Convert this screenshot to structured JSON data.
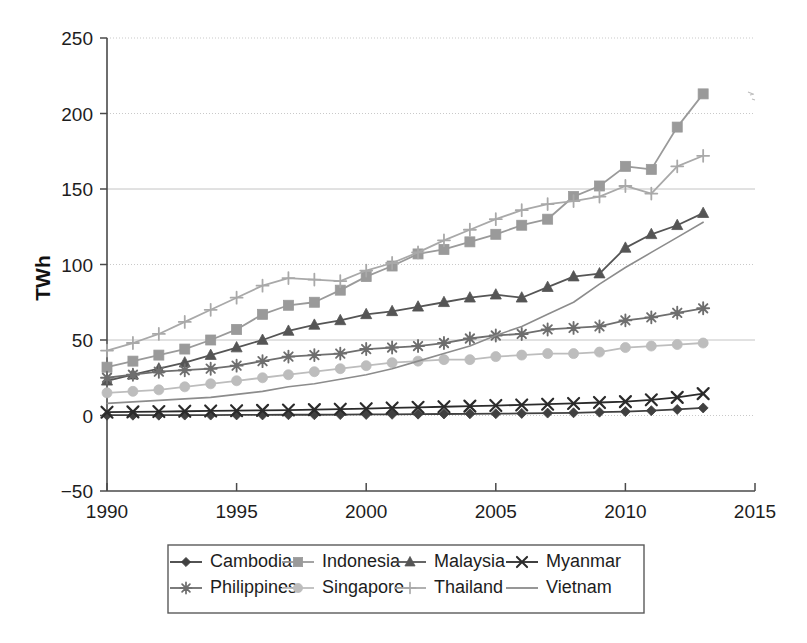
{
  "chart_data": {
    "type": "line",
    "title": "",
    "xlabel": "",
    "ylabel": "TWh",
    "xlim": [
      1990,
      2015
    ],
    "ylim": [
      -50,
      250
    ],
    "ytick_values": [
      250,
      200,
      150,
      100,
      50,
      0,
      -50
    ],
    "ytick_labels": [
      "250",
      "200",
      "150",
      "100",
      "50",
      "0",
      "−50"
    ],
    "xtick_values": [
      1990,
      1995,
      2000,
      2005,
      2010,
      2015
    ],
    "xtick_labels": [
      "1990",
      "1995",
      "2000",
      "2005",
      "2010",
      "2015"
    ],
    "grid": "horizontal",
    "legend_position": "bottom",
    "x": [
      1990,
      1991,
      1992,
      1993,
      1994,
      1995,
      1996,
      1997,
      1998,
      1999,
      2000,
      2001,
      2002,
      2003,
      2004,
      2005,
      2006,
      2007,
      2008,
      2009,
      2010,
      2011,
      2012,
      2013
    ],
    "series": [
      {
        "name": "Cambodia",
        "marker": "diamond",
        "color": "#404040",
        "values": [
          0.2,
          0.2,
          0.2,
          0.3,
          0.3,
          0.4,
          0.4,
          0.5,
          0.5,
          0.6,
          0.7,
          0.8,
          0.9,
          1.0,
          1.1,
          1.2,
          1.4,
          1.6,
          1.8,
          2.2,
          2.6,
          3.2,
          4.0,
          5.0
        ]
      },
      {
        "name": "Indonesia",
        "marker": "square",
        "color": "#9a9a9a",
        "values": [
          32,
          36,
          40,
          44,
          50,
          57,
          67,
          73,
          75,
          83,
          92,
          99,
          107,
          110,
          115,
          120,
          126,
          130,
          145,
          152,
          165,
          163,
          191,
          213
        ]
      },
      {
        "name": "Malaysia",
        "marker": "triangle",
        "color": "#555555",
        "values": [
          23,
          27,
          31,
          35,
          40,
          45,
          50,
          56,
          60,
          63,
          67,
          69,
          72,
          75,
          78,
          80,
          78,
          85,
          92,
          94,
          111,
          120,
          126,
          134
        ]
      },
      {
        "name": "Myanmar",
        "marker": "x",
        "color": "#2b2b2b",
        "values": [
          2.2,
          2.4,
          2.6,
          2.8,
          3.0,
          3.2,
          3.4,
          3.6,
          3.9,
          4.2,
          4.5,
          5.0,
          5.4,
          5.8,
          6.2,
          6.6,
          7.0,
          7.5,
          8.0,
          8.6,
          9.2,
          10.4,
          12.0,
          14.5
        ]
      },
      {
        "name": "Philippines",
        "marker": "star",
        "color": "#6e6e6e",
        "values": [
          25,
          27,
          29,
          30,
          31,
          33,
          36,
          39,
          40,
          41,
          44,
          45,
          46,
          48,
          51,
          53,
          54,
          57,
          58,
          59,
          63,
          65,
          68,
          71
        ]
      },
      {
        "name": "Singapore",
        "marker": "circle",
        "color": "#bdbdbd",
        "values": [
          15,
          16,
          17,
          19,
          21,
          23,
          25,
          27,
          29,
          31,
          33,
          35,
          36,
          37,
          37,
          39,
          40,
          41,
          41,
          42,
          45,
          46,
          47,
          48
        ]
      },
      {
        "name": "Thailand",
        "marker": "plus",
        "color": "#a9a9a9",
        "values": [
          43,
          48,
          54,
          62,
          70,
          78,
          86,
          91,
          90,
          89,
          96,
          101,
          108,
          116,
          123,
          130,
          136,
          140,
          142,
          145,
          152,
          147,
          165,
          172
        ]
      },
      {
        "name": "Vietnam",
        "marker": "none",
        "color": "#8c8c8c",
        "values": [
          8,
          9,
          10,
          11,
          12,
          14,
          16,
          19,
          21,
          24,
          27,
          31,
          36,
          41,
          46,
          53,
          59,
          67,
          75,
          87,
          98,
          108,
          118,
          128
        ]
      }
    ]
  },
  "legend": {
    "rows": [
      [
        {
          "label": "Cambodia",
          "marker": "diamond"
        },
        {
          "label": "Indonesia",
          "marker": "square"
        },
        {
          "label": "Malaysia",
          "marker": "triangle"
        },
        {
          "label": "Myanmar",
          "marker": "x"
        }
      ],
      [
        {
          "label": "Philippines",
          "marker": "star"
        },
        {
          "label": "Singapore",
          "marker": "circle"
        },
        {
          "label": "Thailand",
          "marker": "plus"
        },
        {
          "label": "Vietnam",
          "marker": "none"
        }
      ]
    ]
  }
}
